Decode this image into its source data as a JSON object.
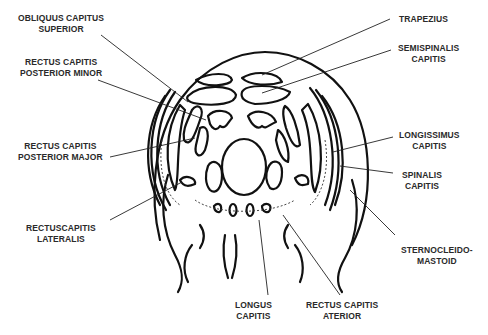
{
  "diagram": {
    "type": "anatomical-cross-section",
    "colors": {
      "stroke": "#111111",
      "text": "#2a2a2a",
      "background": "#ffffff"
    }
  },
  "labels": {
    "obliquus_capitis_superior": {
      "line1": "OBLIQUUS CAPITUS",
      "line2": "SUPERIOR"
    },
    "rectus_capitis_posterior_minor": {
      "line1": "RECTUS CAPITIS",
      "line2": "POSTERIOR MINOR"
    },
    "rectus_capitis_posterior_major": {
      "line1": "RECTUS CAPITIS",
      "line2": "POSTERIOR MAJOR"
    },
    "rectuscapitis_lateralis": {
      "line1": "RECTUSCAPITIS",
      "line2": "LATERALIS"
    },
    "trapezius": {
      "line1": "TRAPEZIUS"
    },
    "semispinalis_capitis": {
      "line1": "SEMISPINALIS",
      "line2": "CAPITIS"
    },
    "longissimus_capitis": {
      "line1": "LONGISSIMUS",
      "line2": "CAPITIS"
    },
    "spinalis_capitis": {
      "line1": "SPINALIS",
      "line2": "CAPITIS"
    },
    "sternocleidomastoid": {
      "line1": "STERNOCLEIDO-",
      "line2": "MASTOID"
    },
    "longus_capitis": {
      "line1": "LONGUS",
      "line2": "CAPITIS"
    },
    "rectus_capitis_anterior": {
      "line1": "RECTUS CAPITIS",
      "line2": "ATERIOR"
    }
  }
}
